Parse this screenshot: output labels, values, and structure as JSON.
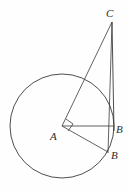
{
  "figure": {
    "background_color": "#fefefe",
    "stroke_color": "#3a3a3a",
    "label_color": "#2b2b2b",
    "circle": {
      "name": "main-circle",
      "center_x": 62,
      "center_y": 126,
      "radius": 52,
      "stroke_width": 0.9
    },
    "points": [
      {
        "id": "C",
        "label": "C",
        "x": 112,
        "y": 22,
        "label_x": 106,
        "label_y": 8
      },
      {
        "id": "A",
        "label": "A",
        "x": 62,
        "y": 126,
        "label_x": 50,
        "label_y": 131
      },
      {
        "id": "B1",
        "label": "B",
        "x": 113,
        "y": 127,
        "label_x": 116,
        "label_y": 124
      },
      {
        "id": "B2",
        "label": "B",
        "x": 108,
        "y": 152,
        "label_x": 111,
        "label_y": 150
      }
    ],
    "segments": [
      {
        "id": "AC",
        "from": "A",
        "to": "C",
        "x1": 62,
        "y1": 126,
        "x2": 112,
        "y2": 22
      },
      {
        "id": "CB1",
        "from": "C",
        "to": "B1",
        "x1": 112,
        "y1": 22,
        "x2": 114,
        "y2": 130
      },
      {
        "id": "CB2",
        "from": "C",
        "to": "B2",
        "x1": 112,
        "y1": 22,
        "x2": 108,
        "y2": 153
      },
      {
        "id": "AB1",
        "from": "A",
        "to": "B1",
        "x1": 62,
        "y1": 126,
        "x2": 114,
        "y2": 126
      },
      {
        "id": "AB2",
        "from": "A",
        "to": "B2",
        "x1": 62,
        "y1": 126,
        "x2": 108,
        "y2": 152
      }
    ],
    "right_angle": {
      "name": "right-angle-marker-at-A",
      "vertex_x": 62,
      "vertex_y": 126,
      "size": 8,
      "points": "66,119 73,124 68,131"
    }
  }
}
